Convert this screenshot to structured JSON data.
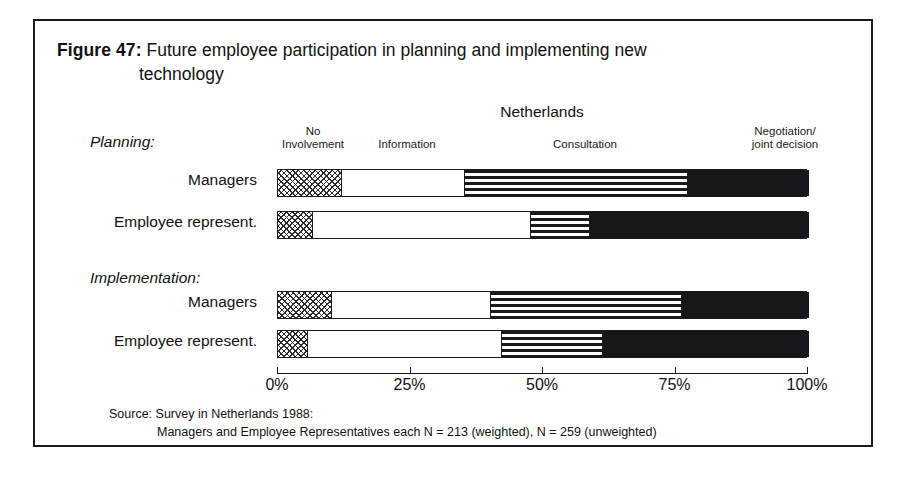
{
  "figure": {
    "label": "Figure 47:",
    "title_line_1": "Future employee participation in planning and implementing new",
    "title_line_2": "technology"
  },
  "source": {
    "line_1": "Source: Survey in Netherlands 1988:",
    "line_2": "Managers and Employee Representatives each N = 213 (weighted), N = 259 (unweighted)"
  },
  "chart_data": {
    "type": "bar",
    "orientation": "horizontal",
    "stacked": true,
    "stacked_normalized": true,
    "title": "Future employee participation in planning and implementing new technology",
    "country": "Netherlands",
    "xlabel": "",
    "ylabel": "",
    "xlim": [
      0,
      100
    ],
    "grid": false,
    "legend_position": "top",
    "tick_labels": [
      "0%",
      "25%",
      "50%",
      "75%",
      "100%"
    ],
    "tick_values": [
      0,
      25,
      50,
      75,
      100
    ],
    "series": [
      {
        "name": "No Involvement",
        "pattern": "checkered-dotted",
        "color": "#ffffff",
        "values": [
          12,
          6.5,
          10,
          5.5
        ]
      },
      {
        "name": "Information",
        "pattern": "solid-white",
        "color": "#ffffff",
        "values": [
          23,
          41,
          30,
          36.5
        ]
      },
      {
        "name": "Consultation",
        "pattern": "horizontal-stripes",
        "color": "#ffffff",
        "values": [
          42,
          11,
          36,
          19
        ]
      },
      {
        "name": "Negotiation/ joint decision",
        "pattern": "solid-black",
        "color": "#17171a",
        "values": [
          23,
          41.5,
          24,
          39
        ]
      }
    ],
    "groups": [
      {
        "name": "Planning:",
        "categories": [
          "Managers",
          "Employee represent."
        ]
      },
      {
        "name": "Implementation:",
        "categories": [
          "Managers",
          "Employee represent."
        ]
      }
    ],
    "categories": [
      "Managers",
      "Employee represent.",
      "Managers",
      "Employee represent."
    ],
    "legend": {
      "no_involvement_line_1": "No",
      "no_involvement_line_2": "Involvement",
      "information": "Information",
      "consultation": "Consultation",
      "negotiation_line_1": "Negotiation/",
      "negotiation_line_2": "joint decision"
    }
  }
}
